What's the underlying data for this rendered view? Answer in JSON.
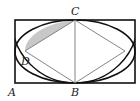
{
  "diagram": {
    "type": "geometry",
    "labels": {
      "A": "A",
      "B": "B",
      "C": "C",
      "D": "D"
    },
    "colors": {
      "stroke": "#111111",
      "thin_stroke": "#777777",
      "shade": "#c8c8c8",
      "background": "#ffffff"
    }
  }
}
